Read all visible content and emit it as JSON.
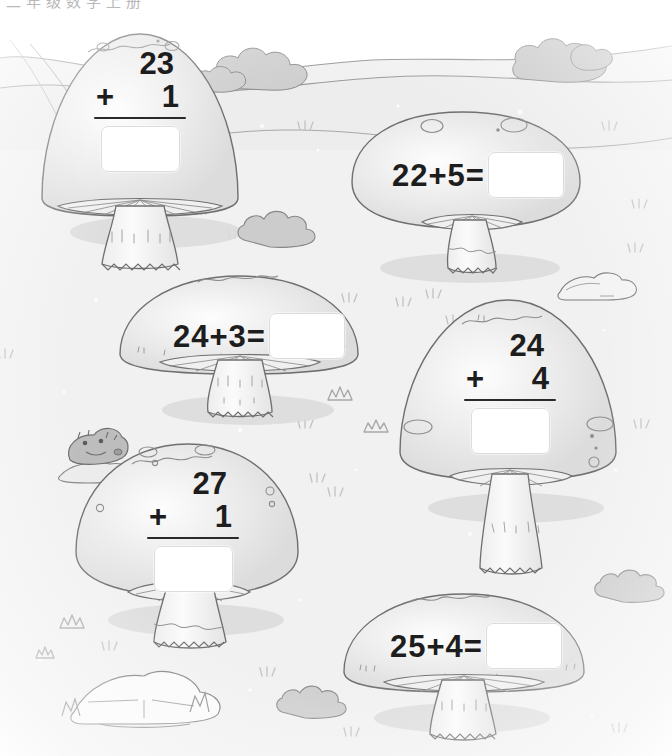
{
  "page": {
    "header_fragment": "二年级数学上册",
    "background_color": "#f1f1f1",
    "ink_color": "#1d1d1d",
    "cap_fill": "#e9e9e9",
    "outline_color": "#6f6f6f",
    "shadow_color": "#d8d8d8",
    "answer_box_fill": "#ffffff",
    "answer_box_border": "#dcdcdc"
  },
  "problems": [
    {
      "id": "problem-1",
      "format": "vertical",
      "addend_top": "23",
      "operator": "+",
      "addend_bottom": "1",
      "answer": "",
      "expression": "23 + 1 ="
    },
    {
      "id": "problem-2",
      "format": "horizontal",
      "expression": "22+5=",
      "addend_top": "22",
      "operator": "+",
      "addend_bottom": "5",
      "answer": ""
    },
    {
      "id": "problem-3",
      "format": "horizontal",
      "expression": "24+3=",
      "addend_top": "24",
      "operator": "+",
      "addend_bottom": "3",
      "answer": ""
    },
    {
      "id": "problem-4",
      "format": "vertical",
      "addend_top": "24",
      "operator": "+",
      "addend_bottom": "4",
      "answer": "",
      "expression": "24 + 4 ="
    },
    {
      "id": "problem-5",
      "format": "vertical",
      "addend_top": "27",
      "operator": "+",
      "addend_bottom": "1",
      "answer": "",
      "expression": "27 + 1 ="
    },
    {
      "id": "problem-6",
      "format": "horizontal",
      "expression": "25+4=",
      "addend_top": "25",
      "operator": "+",
      "addend_bottom": "4",
      "answer": ""
    }
  ],
  "scenery": {
    "hills": "rolling-hills",
    "bushes": [
      "bush-top-left",
      "bush-top-right",
      "bush-mid-left",
      "bush-bottom-right",
      "bush-bottom-center"
    ],
    "rocks": [
      "rock-mid-right",
      "rock-bottom-left",
      "rock-mole-mound"
    ],
    "creature": "mole",
    "grass_tufts": "grass-tuft",
    "mushroom_count": 6
  }
}
